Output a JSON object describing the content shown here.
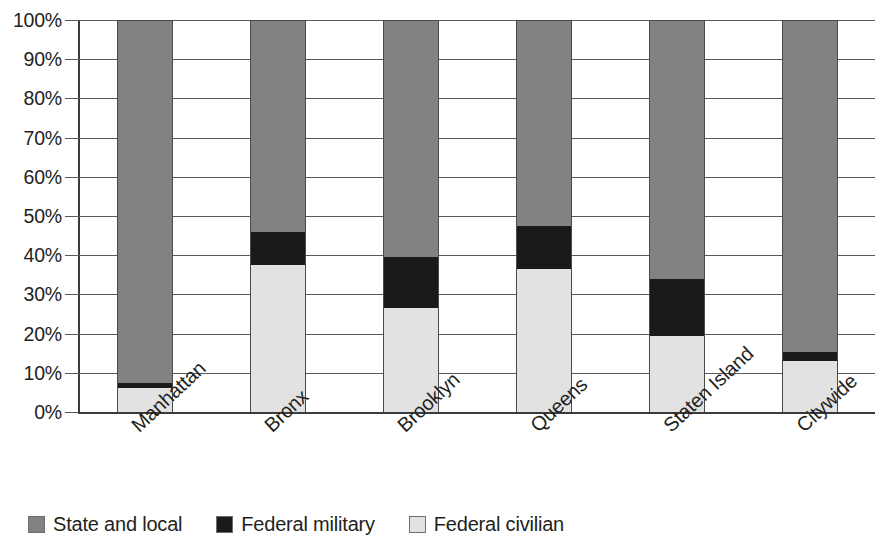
{
  "chart_data": {
    "type": "bar",
    "subtype": "stacked-percentage",
    "title": "",
    "xlabel": "",
    "ylabel": "",
    "ylim": [
      0,
      100
    ],
    "y_tick_labels": [
      "100%",
      "90%",
      "80%",
      "70%",
      "60%",
      "50%",
      "40%",
      "30%",
      "20%",
      "10%",
      "0%"
    ],
    "y_tick_values": [
      100,
      90,
      80,
      70,
      60,
      50,
      40,
      30,
      20,
      10,
      0
    ],
    "grid": true,
    "legend_position": "bottom-left",
    "categories": [
      "Manhattan",
      "Bronx",
      "Brooklyn",
      "Queens",
      "Staten Island",
      "Citywide"
    ],
    "series": [
      {
        "name": "Federal civilian",
        "color": "#e2e2e2",
        "values": [
          6.2,
          37.5,
          26.5,
          36.5,
          19.5,
          13.0
        ]
      },
      {
        "name": "Federal military",
        "color": "#1a1a1a",
        "values": [
          1.3,
          8.5,
          13.0,
          11.0,
          14.5,
          2.3
        ]
      },
      {
        "name": "State and local",
        "color": "#828282",
        "values": [
          92.5,
          54.0,
          60.5,
          52.5,
          66.0,
          84.7
        ]
      }
    ]
  },
  "legend": {
    "items": [
      {
        "label": "State and local",
        "key": "state-and-local",
        "color": "#828282"
      },
      {
        "label": "Federal military",
        "key": "federal-military",
        "color": "#1a1a1a"
      },
      {
        "label": "Federal civilian",
        "key": "federal-civilian",
        "color": "#e2e2e2"
      }
    ]
  }
}
